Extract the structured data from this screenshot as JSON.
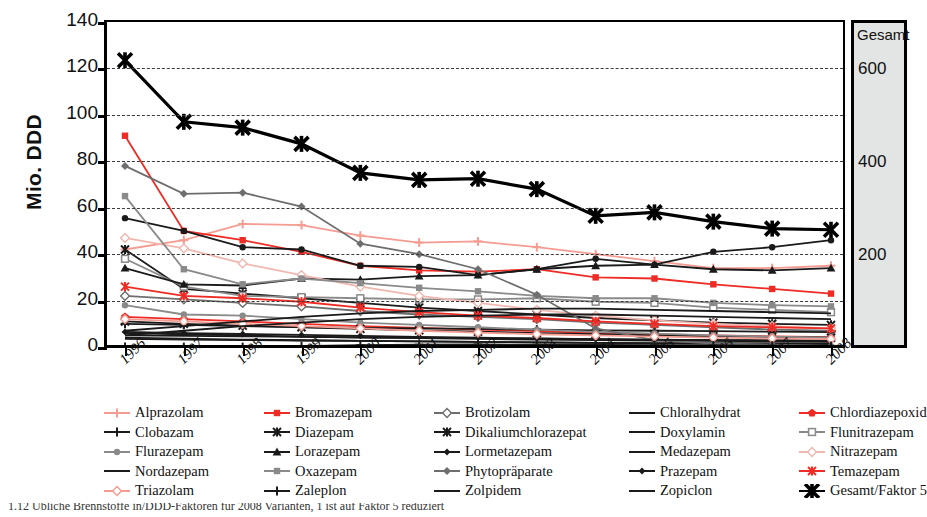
{
  "figure": {
    "ylabel": "Mio. DDD",
    "secondary_panel_title": "Gesamt",
    "top_caption_cut": "",
    "bottom_caption_cut": "1.12   Ubliche Brennstoffe in/DDD-Faktoren fur 2008 Varianten, 1 ist auf Faktor 5 reduziert"
  },
  "chart_data": {
    "type": "line",
    "title": "",
    "xlabel": "",
    "ylabel": "Mio. DDD",
    "ylim": [
      0,
      140
    ],
    "ytick_values": [
      0,
      20,
      40,
      60,
      80,
      100,
      120,
      140
    ],
    "grid": true,
    "legend_position": "bottom",
    "secondary_axis": {
      "label": "Gesamt",
      "tick_values": [
        200,
        400,
        600
      ],
      "factor": 5,
      "note": "Gesamt/Faktor 5"
    },
    "categories": [
      "1996",
      "1997",
      "1998",
      "1999",
      "2000",
      "2001",
      "2002",
      "2003",
      "2004",
      "2005",
      "2006",
      "2007",
      "2008"
    ],
    "series": [
      {
        "name": "Alprazolam",
        "color": "#f49c92",
        "marker": "plus",
        "values": [
          42,
          46,
          53,
          52.5,
          48,
          45,
          45.5,
          43,
          40,
          37,
          34,
          34,
          35
        ]
      },
      {
        "name": "Bromazepam",
        "color": "#ee2b24",
        "marker": "square",
        "values": [
          91,
          50,
          46,
          41,
          35,
          33,
          32.5,
          33.5,
          30,
          29.5,
          27,
          25,
          23
        ]
      },
      {
        "name": "Brotizolam",
        "color": "#6e6e6e",
        "marker": "diamond-open",
        "values": [
          22,
          20.5,
          19,
          17.5,
          15.5,
          14,
          13,
          12,
          10.5,
          9.5,
          8.5,
          7.5,
          7
        ]
      },
      {
        "name": "Chloralhydrat",
        "color": "#1a1a1a",
        "marker": "none",
        "values": [
          6,
          5.5,
          5,
          4.5,
          4,
          3.8,
          3.5,
          3.2,
          3,
          2.8,
          2.6,
          2.4,
          2.2
        ]
      },
      {
        "name": "Chlordiazepoxid",
        "color": "#ee2b24",
        "marker": "pentagon",
        "values": [
          13,
          12,
          11,
          10,
          9,
          8.2,
          7.5,
          6.8,
          6,
          5.5,
          5,
          4.6,
          4.2
        ]
      },
      {
        "name": "Clobazam",
        "color": "#1a1a1a",
        "marker": "plus",
        "values": [
          10,
          9.5,
          9,
          8.6,
          8.2,
          8,
          7.8,
          7.5,
          7.2,
          7,
          6.8,
          6.6,
          6.4
        ]
      },
      {
        "name": "Diazepam",
        "color": "#1a1a1a",
        "marker": "star",
        "values": [
          42,
          25,
          23,
          21,
          19,
          17,
          15.5,
          14,
          12.5,
          11.5,
          10.5,
          10,
          9.5
        ]
      },
      {
        "name": "Dikaliumchlorazepat",
        "color": "#1a1a1a",
        "marker": "star",
        "values": [
          11,
          10,
          9.2,
          8.5,
          7.8,
          7.2,
          6.6,
          6,
          5.5,
          5,
          4.6,
          4.3,
          4
        ]
      },
      {
        "name": "Doxylamin",
        "color": "#1a1a1a",
        "marker": "none",
        "values": [
          5,
          4.8,
          4.6,
          4.4,
          4.2,
          4,
          3.8,
          3.6,
          3.4,
          3.2,
          3,
          2.9,
          2.8
        ]
      },
      {
        "name": "Flunitrazepam",
        "color": "#8a8a8a",
        "marker": "square-open",
        "values": [
          38,
          26,
          22,
          21.5,
          21,
          20.5,
          20.5,
          21,
          19.5,
          19,
          17,
          16,
          15
        ]
      },
      {
        "name": "Flurazepam",
        "color": "#8a8a8a",
        "marker": "circle",
        "values": [
          18,
          14,
          13.5,
          12,
          10.5,
          9.5,
          8.5,
          7.5,
          6.5,
          5.8,
          5,
          4.5,
          4
        ]
      },
      {
        "name": "Lorazepam",
        "color": "#1a1a1a",
        "marker": "triangle",
        "values": [
          34,
          27,
          26.5,
          29.5,
          29,
          30.5,
          31,
          33.5,
          35,
          35.5,
          33.5,
          33,
          34
        ]
      },
      {
        "name": "Lormetazepam",
        "color": "#1a1a1a",
        "marker": "circle",
        "values": [
          55.5,
          50,
          43,
          42,
          35,
          34.5,
          31,
          33.5,
          38,
          35.5,
          41,
          43,
          46
        ]
      },
      {
        "name": "Medazepam",
        "color": "#1a1a1a",
        "marker": "none",
        "values": [
          4,
          3.6,
          3.2,
          2.9,
          2.6,
          2.4,
          2.2,
          2,
          1.8,
          1.6,
          1.5,
          1.4,
          1.3
        ]
      },
      {
        "name": "Nitrazepam",
        "color": "#f0b8b0",
        "marker": "diamond-open",
        "values": [
          47,
          42.5,
          36,
          31,
          26,
          22,
          19,
          16,
          13.5,
          11.5,
          10,
          9,
          8
        ]
      },
      {
        "name": "Nordazepam",
        "color": "#1a1a1a",
        "marker": "none",
        "values": [
          3.5,
          3.2,
          3,
          2.8,
          2.6,
          2.4,
          2.2,
          2,
          1.8,
          1.7,
          1.6,
          1.5,
          1.4
        ]
      },
      {
        "name": "Oxazepam",
        "color": "#8a8a8a",
        "marker": "square",
        "values": [
          65,
          33.5,
          27,
          29.5,
          27.5,
          25.5,
          24,
          22,
          21,
          21,
          19,
          18,
          17.5
        ]
      },
      {
        "name": "Phytopraparate",
        "color": "#6e6e6e",
        "marker": "diamond",
        "values": [
          78,
          66,
          66.5,
          60.5,
          44.5,
          40,
          33.5,
          22.5,
          8,
          3,
          1.5,
          1,
          0.5
        ]
      },
      {
        "name": "Prazepam",
        "color": "#1a1a1a",
        "marker": "diamond-small",
        "values": [
          6.5,
          6,
          5.6,
          5.2,
          4.8,
          4.4,
          4,
          3.7,
          3.4,
          3.1,
          2.9,
          2.7,
          2.5
        ]
      },
      {
        "name": "Temazepam",
        "color": "#ee2b24",
        "marker": "star",
        "values": [
          26,
          22,
          21,
          19.5,
          17,
          15,
          13.5,
          12.5,
          11,
          10,
          9,
          8.5,
          8
        ]
      },
      {
        "name": "Triazolam",
        "color": "#f49c92",
        "marker": "diamond-open",
        "values": [
          12,
          11,
          10,
          9,
          8,
          7,
          6.2,
          5.5,
          5,
          4.5,
          4,
          3.7,
          3.4
        ]
      },
      {
        "name": "Zaleplon",
        "color": "#1a1a1a",
        "marker": "plus",
        "values": [
          0,
          0,
          0,
          0.4,
          0.8,
          1,
          1.1,
          1,
          0.9,
          0.8,
          0.7,
          0.6,
          0.5
        ]
      },
      {
        "name": "Zolpidem",
        "color": "#1a1a1a",
        "marker": "none",
        "values": [
          7,
          9,
          11,
          13,
          14.5,
          15.5,
          16,
          16.5,
          16.5,
          16,
          15.5,
          15,
          14.5
        ]
      },
      {
        "name": "Zopiclon",
        "color": "#1a1a1a",
        "marker": "none",
        "values": [
          5,
          7,
          9,
          10.5,
          12,
          13,
          13.5,
          14,
          14,
          13.5,
          13,
          12.5,
          12
        ]
      },
      {
        "name": "Gesamt/Faktor 5",
        "color": "#000000",
        "marker": "bigstar",
        "values": [
          123.5,
          97,
          94.5,
          87.5,
          75,
          72,
          72.5,
          68,
          56.5,
          58,
          54,
          51,
          50.5
        ]
      }
    ]
  },
  "legend": {
    "columns": 5,
    "rows": 5,
    "entries": [
      {
        "label": "Alprazolam",
        "color": "#f49c92",
        "marker": "plus"
      },
      {
        "label": "Bromazepam",
        "color": "#ee2b24",
        "marker": "square"
      },
      {
        "label": "Brotizolam",
        "color": "#6e6e6e",
        "marker": "diamond-open"
      },
      {
        "label": "Chloralhydrat",
        "color": "#1a1a1a",
        "marker": "none"
      },
      {
        "label": "Chlordiazepoxid",
        "color": "#ee2b24",
        "marker": "pentagon"
      },
      {
        "label": "Clobazam",
        "color": "#1a1a1a",
        "marker": "plus"
      },
      {
        "label": "Diazepam",
        "color": "#1a1a1a",
        "marker": "star"
      },
      {
        "label": "Dikaliumchlorazepat",
        "color": "#1a1a1a",
        "marker": "star"
      },
      {
        "label": "Doxylamin",
        "color": "#1a1a1a",
        "marker": "none"
      },
      {
        "label": "Flunitrazepam",
        "color": "#8a8a8a",
        "marker": "square-open"
      },
      {
        "label": "Flurazepam",
        "color": "#8a8a8a",
        "marker": "circle"
      },
      {
        "label": "Lorazepam",
        "color": "#1a1a1a",
        "marker": "triangle"
      },
      {
        "label": "Lormetazepam",
        "color": "#1a1a1a",
        "marker": "diamond-small"
      },
      {
        "label": "Medazepam",
        "color": "#1a1a1a",
        "marker": "none"
      },
      {
        "label": "Nitrazepam",
        "color": "#f0b8b0",
        "marker": "diamond-open"
      },
      {
        "label": "Nordazepam",
        "color": "#1a1a1a",
        "marker": "none"
      },
      {
        "label": "Oxazepam",
        "color": "#8a8a8a",
        "marker": "square"
      },
      {
        "label": "Phytopräparate",
        "color": "#6e6e6e",
        "marker": "diamond"
      },
      {
        "label": "Prazepam",
        "color": "#1a1a1a",
        "marker": "diamond-small"
      },
      {
        "label": "Temazepam",
        "color": "#ee2b24",
        "marker": "star"
      },
      {
        "label": "Triazolam",
        "color": "#f49c92",
        "marker": "diamond-open"
      },
      {
        "label": "Zaleplon",
        "color": "#1a1a1a",
        "marker": "plus"
      },
      {
        "label": "Zolpidem",
        "color": "#1a1a1a",
        "marker": "none"
      },
      {
        "label": "Zopiclon",
        "color": "#1a1a1a",
        "marker": "none"
      },
      {
        "label": "Gesamt/Faktor 5",
        "color": "#000000",
        "marker": "bigstar"
      }
    ]
  }
}
